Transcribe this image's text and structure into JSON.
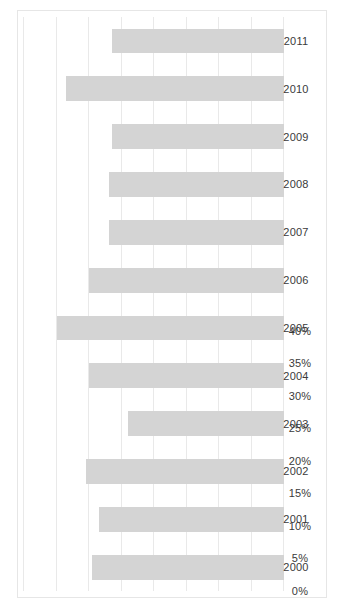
{
  "chart_data": {
    "type": "bar",
    "orientation": "horizontal",
    "title": "",
    "subtitle": "",
    "xlabel": "",
    "ylabel": "",
    "categories": [
      "2000",
      "2001",
      "2002",
      "2003",
      "2004",
      "2005",
      "2006",
      "2007",
      "2008",
      "2009",
      "2010",
      "2011"
    ],
    "values": [
      29.5,
      28.5,
      30.5,
      24.0,
      30.0,
      35.0,
      30.0,
      27.0,
      27.0,
      26.5,
      33.5,
      26.5
    ],
    "value_tick_labels": [
      "0%",
      "5%",
      "10%",
      "15%",
      "20%",
      "25%",
      "30%",
      "35%",
      "40%"
    ],
    "value_ticks": [
      0,
      5,
      10,
      15,
      20,
      25,
      30,
      35,
      40
    ],
    "ylim": [
      0,
      40
    ],
    "grid": true,
    "legend": false,
    "legend_position": "none",
    "series": [
      {
        "name": "",
        "values": [
          29.5,
          28.5,
          30.5,
          24.0,
          30.0,
          35.0,
          30.0,
          27.0,
          27.0,
          26.5,
          33.5,
          26.5
        ]
      }
    ]
  },
  "colors": {
    "bar": "#d4d4d4",
    "gridline": "#e9e9e9",
    "frame": "#e6e6e6",
    "tick_text": "#3a3a3a",
    "background": "#ffffff"
  }
}
